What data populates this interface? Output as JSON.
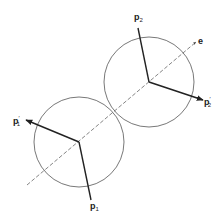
{
  "diagram": {
    "axis_label": "e",
    "labels": {
      "p1": {
        "base": "p",
        "sub": "1",
        "prime": ""
      },
      "p2": {
        "base": "p",
        "sub": "2",
        "prime": ""
      },
      "p1_prime": {
        "base": "p",
        "sub": "1",
        "prime": "′"
      },
      "p2_prime": {
        "base": "p",
        "sub": "2",
        "prime": "′"
      }
    },
    "colors": {
      "stroke": "#222222",
      "circle": "#555555",
      "dash": "#666666"
    }
  }
}
